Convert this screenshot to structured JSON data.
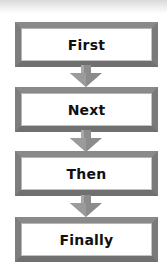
{
  "diagram": {
    "type": "flowchart",
    "direction": "top-to-bottom",
    "steps": [
      {
        "label": "First"
      },
      {
        "label": "Next"
      },
      {
        "label": "Then"
      },
      {
        "label": "Finally"
      }
    ],
    "colors": {
      "box_border": "#7a7a7a",
      "box_fill": "#ffffff",
      "arrow": "#8c8c8c",
      "text": "#111111"
    }
  }
}
